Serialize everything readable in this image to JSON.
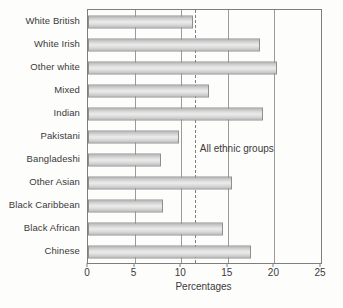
{
  "chart_data": {
    "type": "bar",
    "orientation": "horizontal",
    "title": "",
    "xlabel": "Percentages",
    "ylabel": "",
    "xlim": [
      0,
      25
    ],
    "xticks": [
      0,
      5,
      10,
      15,
      20,
      25
    ],
    "grid": true,
    "categories": [
      "White British",
      "White Irish",
      "Other white",
      "Mixed",
      "Indian",
      "Pakistani",
      "Bangladeshi",
      "Other Asian",
      "Black Caribbean",
      "Black African",
      "Chinese"
    ],
    "values": [
      11.3,
      18.5,
      20.3,
      13.0,
      18.8,
      9.8,
      7.8,
      15.4,
      8.1,
      14.5,
      17.5
    ],
    "reference_line": {
      "label": "All ethnic groups",
      "value": 11.5,
      "style": "dashed"
    },
    "bar_fill_color": "#dcdcdc",
    "bar_border_color": "#8f8f8f",
    "axis_color": "#7e7e7e",
    "gridline_color": "#9a9a9a"
  }
}
